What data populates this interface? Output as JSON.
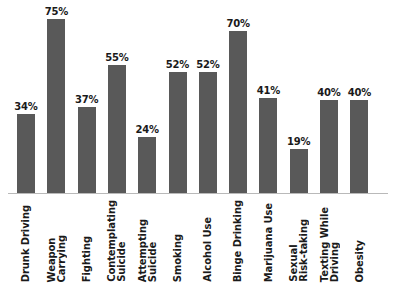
{
  "chart_data": {
    "type": "bar",
    "title": "",
    "subtitle": "",
    "xlabel": "",
    "ylabel": "",
    "ylim": [
      0,
      80
    ],
    "grid": false,
    "legend": false,
    "legend_position": "none",
    "bar_color": "#595959",
    "label_color": "#1a1a1a",
    "axis_color": "#b9b9b9",
    "background_color": "#ffffff",
    "value_suffix": "%",
    "categories": [
      "Drunk Driving",
      "Weapon Carrying",
      "Fighting",
      "Contemplating Suicide",
      "Attempting Suicide",
      "Smoking",
      "Alcohol Use",
      "Binge Drinking",
      "Marijuana Use",
      "Sexual Risk-taking",
      "Texting While Driving",
      "Obesity"
    ],
    "category_lines": [
      "Drunk Driving",
      "Weapon\nCarrying",
      "Fighting",
      "Contemplating\nSuicide",
      "Attempting\nSuicide",
      "Smoking",
      "Alcohol Use",
      "Binge Drinking",
      "Marijuana Use",
      "Sexual\nRisk-taking",
      "Texting While\nDriving",
      "Obesity"
    ],
    "values": [
      34,
      75,
      37,
      55,
      24,
      52,
      52,
      70,
      41,
      19,
      40,
      40
    ],
    "value_labels": [
      "34%",
      "75%",
      "37%",
      "55%",
      "24%",
      "52%",
      "52%",
      "70%",
      "41%",
      "19%",
      "40%",
      "40%"
    ]
  }
}
